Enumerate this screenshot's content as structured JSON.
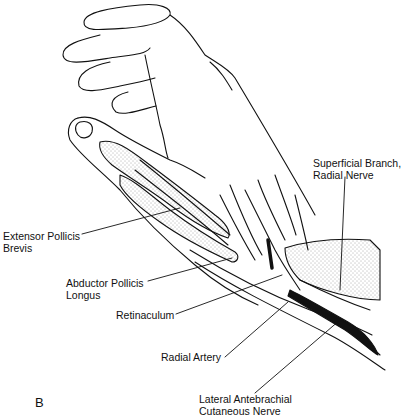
{
  "figure": {
    "panel_letter": "B",
    "labels": [
      {
        "id": "superficial-branch-radial-nerve",
        "line1": "Superficial Branch,",
        "line2": "Radial Nerve"
      },
      {
        "id": "extensor-pollicis-brevis",
        "line1": "Extensor Pollicis",
        "line2": "Brevis"
      },
      {
        "id": "abductor-pollicis-longus",
        "line1": "Abductor Pollicis",
        "line2": "Longus"
      },
      {
        "id": "retinaculum",
        "line1": "Retinaculum",
        "line2": ""
      },
      {
        "id": "radial-artery",
        "line1": "Radial Artery",
        "line2": ""
      },
      {
        "id": "lateral-antebrachial-cutaneous-nerve",
        "line1": "Lateral Antebrachial",
        "line2": "Cutaneous Nerve"
      }
    ]
  }
}
